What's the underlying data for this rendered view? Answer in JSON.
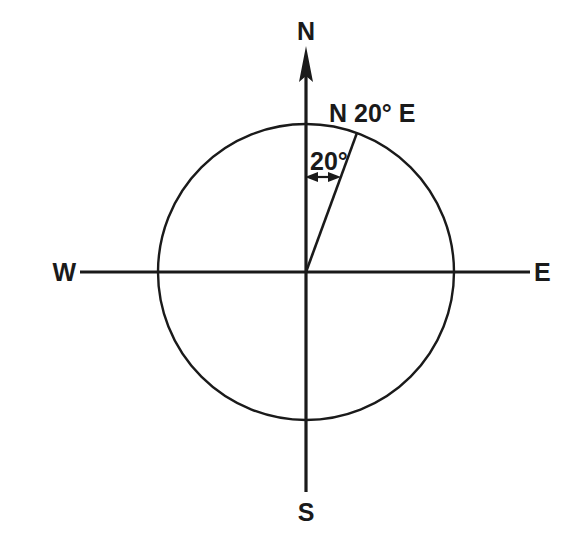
{
  "diagram": {
    "kind": "compass-bearing-diagram",
    "background_color": "#ffffff",
    "ink_color": "#1a1a1a",
    "cardinals": {
      "north": "N",
      "south": "S",
      "east": "E",
      "west": "W"
    },
    "bearing": {
      "label": "N 20° E",
      "angle_label": "20°",
      "angle_degrees": 20,
      "reference_direction": "N",
      "rotation_direction": "E"
    },
    "geometry": {
      "center_x": 306,
      "center_y": 272,
      "radius": 148,
      "north_axis_tip_y": 48,
      "south_axis_end_y": 492,
      "west_axis_end_x": 80,
      "east_axis_end_x": 530,
      "ray_end_x": 357,
      "ray_end_y": 133,
      "angle_marker_y": 177
    }
  }
}
